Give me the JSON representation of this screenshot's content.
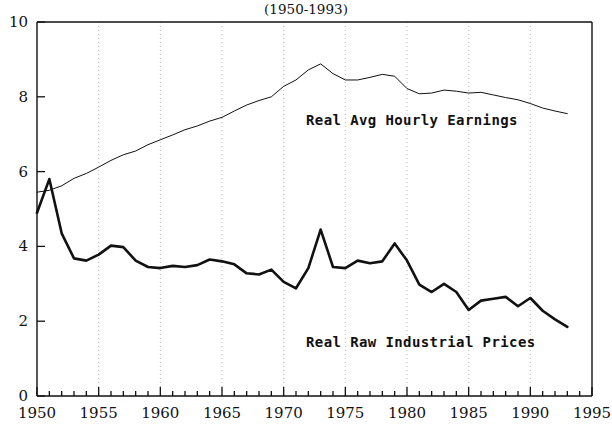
{
  "chart_data": {
    "type": "line",
    "title": "(1950-1993)",
    "xlabel": "",
    "ylabel": "",
    "xlim": [
      1950,
      1995
    ],
    "ylim": [
      0,
      10
    ],
    "grid": true,
    "grid_style": "dotted-vertical-major",
    "legend_position": "inline-annotations",
    "x_ticks_major": [
      1950,
      1955,
      1960,
      1965,
      1970,
      1975,
      1980,
      1985,
      1990,
      1995
    ],
    "x_ticks_major_labels": [
      "1950",
      "1955",
      "1960",
      "1965",
      "1970",
      "1975",
      "1980",
      "1985",
      "1990",
      "1995"
    ],
    "x_tick_minor_step": 1,
    "y_ticks": [
      0,
      2,
      4,
      6,
      8,
      10
    ],
    "y_tick_labels": [
      "0",
      "2",
      "4",
      "6",
      "8",
      "10"
    ],
    "x": [
      1950,
      1951,
      1952,
      1953,
      1954,
      1955,
      1956,
      1957,
      1958,
      1959,
      1960,
      1961,
      1962,
      1963,
      1964,
      1965,
      1966,
      1967,
      1968,
      1969,
      1970,
      1971,
      1972,
      1973,
      1974,
      1975,
      1976,
      1977,
      1978,
      1979,
      1980,
      1981,
      1982,
      1983,
      1984,
      1985,
      1986,
      1987,
      1988,
      1989,
      1990,
      1991,
      1992,
      1993
    ],
    "series": [
      {
        "name": "Real Avg Hourly Earnings",
        "label": "Real Avg Hourly Earnings",
        "line_width": 1,
        "color": "#111111",
        "values": [
          5.45,
          5.5,
          5.62,
          5.82,
          5.95,
          6.12,
          6.3,
          6.45,
          6.55,
          6.72,
          6.85,
          6.98,
          7.12,
          7.22,
          7.35,
          7.45,
          7.62,
          7.78,
          7.9,
          8.0,
          8.28,
          8.45,
          8.72,
          8.88,
          8.62,
          8.45,
          8.45,
          8.52,
          8.6,
          8.55,
          8.22,
          8.08,
          8.1,
          8.18,
          8.15,
          8.1,
          8.12,
          8.05,
          7.98,
          7.92,
          7.82,
          7.7,
          7.62,
          7.55
        ]
      },
      {
        "name": "Real Raw Industrial Prices",
        "label": "Real Raw Industrial Prices",
        "line_width": 2.6,
        "color": "#111111",
        "values": [
          4.9,
          5.8,
          4.35,
          3.68,
          3.62,
          3.78,
          4.02,
          3.98,
          3.62,
          3.45,
          3.42,
          3.48,
          3.45,
          3.5,
          3.65,
          3.6,
          3.52,
          3.28,
          3.25,
          3.38,
          3.05,
          2.88,
          3.42,
          4.45,
          3.45,
          3.42,
          3.62,
          3.55,
          3.6,
          4.08,
          3.62,
          2.98,
          2.78,
          3.0,
          2.78,
          2.3,
          2.55,
          2.6,
          2.65,
          2.4,
          2.62,
          2.28,
          2.05,
          1.85
        ]
      }
    ]
  },
  "annotations": {
    "earnings_label": "Real Avg Hourly Earnings",
    "prices_label": "Real Raw Industrial Prices"
  }
}
